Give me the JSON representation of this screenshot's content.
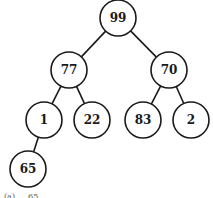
{
  "diagram": {
    "type": "binary-tree",
    "nodes": [
      {
        "id": "n0",
        "label": "99",
        "x": 118,
        "y": 18
      },
      {
        "id": "n1",
        "label": "77",
        "x": 69,
        "y": 70
      },
      {
        "id": "n2",
        "label": "70",
        "x": 169,
        "y": 70
      },
      {
        "id": "n3",
        "label": "1",
        "x": 44,
        "y": 120
      },
      {
        "id": "n4",
        "label": "22",
        "x": 92,
        "y": 120
      },
      {
        "id": "n5",
        "label": "83",
        "x": 143,
        "y": 120
      },
      {
        "id": "n6",
        "label": "2",
        "x": 191,
        "y": 120
      },
      {
        "id": "n7",
        "label": "65",
        "x": 28,
        "y": 169
      }
    ],
    "edges": [
      [
        "n0",
        "n1"
      ],
      [
        "n0",
        "n2"
      ],
      [
        "n1",
        "n3"
      ],
      [
        "n1",
        "n4"
      ],
      [
        "n2",
        "n5"
      ],
      [
        "n2",
        "n6"
      ],
      [
        "n3",
        "n7"
      ]
    ],
    "node_radius": 18,
    "caption": "(a) … 65"
  }
}
